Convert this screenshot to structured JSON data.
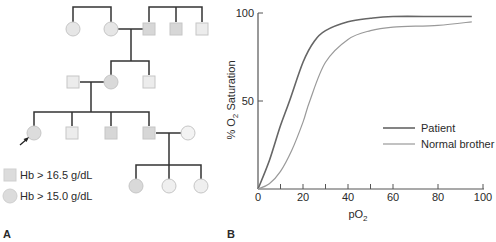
{
  "panels": {
    "a": {
      "label": "A"
    },
    "b": {
      "label": "B"
    }
  },
  "pedigree": {
    "legend": [
      {
        "shape": "square",
        "text": "Hb > 16.5 g/dL"
      },
      {
        "shape": "circle",
        "text": "Hb > 15.0 g/dL"
      }
    ],
    "colors": {
      "line": "#333333",
      "fill_affected": "#d9d9d9",
      "fill_light": "#ececec",
      "stroke": "#c8c8c8"
    },
    "proband_marker": "arrow"
  },
  "chart_data": {
    "type": "line",
    "title": "",
    "xlabel": "pO2",
    "ylabel": "% O2 Saturation",
    "xlim": [
      0,
      100
    ],
    "ylim": [
      0,
      100
    ],
    "x_ticks": [
      0,
      10,
      20,
      30,
      40,
      50,
      60,
      80,
      100
    ],
    "x_tick_labels": [
      "0",
      "20",
      "40",
      "60",
      "80",
      "100"
    ],
    "y_tick_labels": [
      "50",
      "100"
    ],
    "grid": false,
    "legend_position": "center-right",
    "series": [
      {
        "name": "Patient",
        "color": "#666666",
        "x": [
          0,
          5,
          10,
          14,
          20,
          25,
          30,
          40,
          50,
          60,
          80,
          95
        ],
        "values": [
          0,
          16,
          36,
          50,
          72,
          84,
          90,
          95,
          97,
          98,
          98,
          98
        ]
      },
      {
        "name": "Normal brother",
        "color": "#999999",
        "x": [
          0,
          5,
          10,
          15,
          20,
          23,
          30,
          40,
          50,
          60,
          80,
          95
        ],
        "values": [
          0,
          3,
          10,
          22,
          38,
          50,
          72,
          85,
          90,
          92,
          93,
          95
        ]
      }
    ]
  },
  "axis": {
    "xlabel_main": "pO",
    "xlabel_sub": "2",
    "ylabel_pre": "% O",
    "ylabel_sub": "2",
    "ylabel_post": " Saturation",
    "x_tick_labels": [
      "0",
      "20",
      "40",
      "60",
      "80",
      "100"
    ],
    "y_tick_labels": [
      "50",
      "100"
    ]
  },
  "legend": {
    "items": [
      "Patient",
      "Normal brother"
    ]
  }
}
